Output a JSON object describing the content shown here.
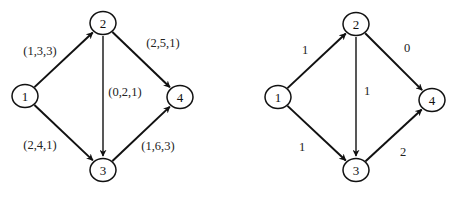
{
  "graphs": [
    {
      "id": "left",
      "nodes": [
        {
          "id": "1",
          "label": "1",
          "x": 25,
          "y": 96
        },
        {
          "id": "2",
          "label": "2",
          "x": 103,
          "y": 23
        },
        {
          "id": "3",
          "label": "3",
          "x": 103,
          "y": 170
        },
        {
          "id": "4",
          "label": "4",
          "x": 180,
          "y": 97
        }
      ],
      "edges": [
        {
          "from": "1",
          "to": "2",
          "label": "(1,3,3)",
          "lx": 40,
          "ly": 51
        },
        {
          "from": "2",
          "to": "3",
          "label": "(0,2,1)",
          "lx": 125,
          "ly": 92
        },
        {
          "from": "2",
          "to": "4",
          "label": "(2,5,1)",
          "lx": 163,
          "ly": 43
        },
        {
          "from": "1",
          "to": "3",
          "label": "(2,4,1)",
          "lx": 40,
          "ly": 145
        },
        {
          "from": "3",
          "to": "4",
          "label": "(1,6,3)",
          "lx": 158,
          "ly": 146
        }
      ]
    },
    {
      "id": "right",
      "nodes": [
        {
          "id": "1",
          "label": "1",
          "x": 278,
          "y": 97
        },
        {
          "id": "2",
          "label": "2",
          "x": 356,
          "y": 24
        },
        {
          "id": "3",
          "label": "3",
          "x": 356,
          "y": 170
        },
        {
          "id": "4",
          "label": "4",
          "x": 432,
          "y": 100
        }
      ],
      "edges": [
        {
          "from": "1",
          "to": "2",
          "label": "1",
          "lx": 305,
          "ly": 50
        },
        {
          "from": "2",
          "to": "3",
          "label": "1",
          "lx": 367,
          "ly": 91
        },
        {
          "from": "2",
          "to": "4",
          "label": "0",
          "lx": 407,
          "ly": 48
        },
        {
          "from": "1",
          "to": "3",
          "label": "1",
          "lx": 302,
          "ly": 147
        },
        {
          "from": "3",
          "to": "4",
          "label": "2",
          "lx": 403,
          "ly": 152
        }
      ]
    }
  ]
}
